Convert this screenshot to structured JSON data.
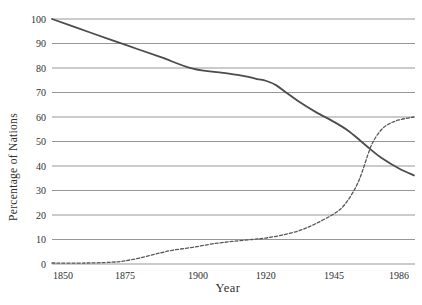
{
  "chart_data": {
    "type": "line",
    "title": "",
    "xlabel": "Year",
    "ylabel": "Percentage of Nations",
    "x_tick_labels": [
      "1850",
      "1875",
      "1900",
      "1920",
      "1945",
      "1986"
    ],
    "x_tick_fractions": [
      0.03,
      0.201,
      0.402,
      0.589,
      0.777,
      0.956
    ],
    "y_ticks": [
      0,
      10,
      20,
      30,
      40,
      50,
      60,
      70,
      80,
      90,
      100
    ],
    "ylim": [
      0,
      100
    ],
    "grid": "horizontal",
    "legend": "none",
    "axis_note": "x tick years are evenly spaced (categorical spacing, not linear years)",
    "colors": {
      "background": "#ffffff",
      "grid": "#979797",
      "text": "#2f2f2f",
      "solid_series": "#4c4c4c",
      "dashed_series": "#585858"
    },
    "series": [
      {
        "name": "solid-declining-line",
        "style": "solid",
        "color": "#4c4c4c",
        "width": 1.8,
        "values_at_ticks": [
          100,
          89.5,
          79.7,
          74.8,
          58,
          39
        ],
        "end_value": 36.2,
        "points": [
          [
            0.0,
            100
          ],
          [
            0.105,
            94.5
          ],
          [
            0.201,
            89.5
          ],
          [
            0.298,
            84.5
          ],
          [
            0.388,
            79.7
          ],
          [
            0.471,
            78.0
          ],
          [
            0.526,
            76.8
          ],
          [
            0.565,
            75.5
          ],
          [
            0.589,
            74.8
          ],
          [
            0.617,
            73.0
          ],
          [
            0.645,
            70.0
          ],
          [
            0.683,
            66.0
          ],
          [
            0.727,
            62.0
          ],
          [
            0.777,
            58.0
          ],
          [
            0.815,
            54.5
          ],
          [
            0.848,
            50.5
          ],
          [
            0.876,
            47.0
          ],
          [
            0.906,
            43.5
          ],
          [
            0.956,
            39.0
          ],
          [
            0.997,
            36.2
          ]
        ]
      },
      {
        "name": "dashed-rising-line",
        "style": "dashed",
        "color": "#585858",
        "width": 1.3,
        "dash": [
          3,
          2
        ],
        "values_at_ticks": [
          0.4,
          1.3,
          6.8,
          10.6,
          20.5,
          58.8
        ],
        "end_value": 60,
        "points": [
          [
            0.0,
            0.4
          ],
          [
            0.091,
            0.4
          ],
          [
            0.146,
            0.6
          ],
          [
            0.182,
            0.9
          ],
          [
            0.201,
            1.3
          ],
          [
            0.237,
            2.3
          ],
          [
            0.284,
            4.0
          ],
          [
            0.331,
            5.6
          ],
          [
            0.388,
            6.8
          ],
          [
            0.441,
            8.2
          ],
          [
            0.496,
            9.2
          ],
          [
            0.551,
            10.0
          ],
          [
            0.589,
            10.6
          ],
          [
            0.634,
            11.8
          ],
          [
            0.683,
            13.7
          ],
          [
            0.727,
            16.5
          ],
          [
            0.777,
            20.5
          ],
          [
            0.802,
            23.5
          ],
          [
            0.826,
            28.5
          ],
          [
            0.848,
            35.0
          ],
          [
            0.876,
            47.0
          ],
          [
            0.893,
            52.0
          ],
          [
            0.912,
            55.5
          ],
          [
            0.93,
            57.3
          ],
          [
            0.956,
            58.8
          ],
          [
            0.997,
            60.0
          ]
        ]
      }
    ]
  }
}
